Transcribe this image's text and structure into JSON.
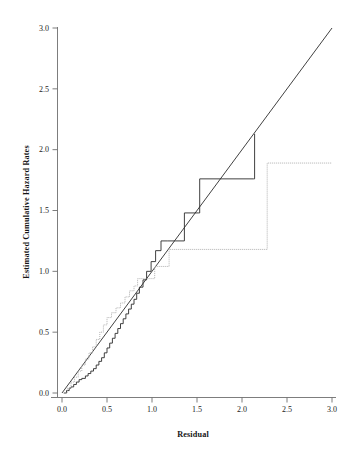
{
  "chart_data": {
    "type": "line",
    "title": "",
    "xlabel": "Residual",
    "ylabel": "Estimated Cumulative Hazard Rates",
    "xlim": [
      0.0,
      3.0
    ],
    "ylim": [
      0.0,
      3.0
    ],
    "grid": false,
    "legend": "none",
    "xticks": [
      "0.0",
      "0.5",
      "1.0",
      "1.5",
      "2.0",
      "2.5",
      "3.0"
    ],
    "xtick_values": [
      0.0,
      0.5,
      1.0,
      1.5,
      2.0,
      2.5,
      3.0
    ],
    "yticks": [
      "0.0",
      "0.5",
      "1.0",
      "1.5",
      "2.0",
      "2.5",
      "3.0"
    ],
    "ytick_values": [
      0.0,
      0.5,
      1.0,
      1.5,
      2.0,
      2.5,
      3.0
    ],
    "colors": {
      "reference_line": "#2b2b2b",
      "black_step": "#2b2b2b",
      "gray_step": "#a8a8a8",
      "axis": "#6e6e6e",
      "text": "#1c1c1c",
      "background": "#ffffff"
    },
    "series": [
      {
        "name": "reference-line",
        "style": "solid-straight",
        "color": "#2b2b2b",
        "x": [
          0.0,
          3.0
        ],
        "values": [
          0.0,
          3.0
        ]
      },
      {
        "name": "black-step-curve",
        "style": "step-solid",
        "color": "#2b2b2b",
        "x": [
          0.02,
          0.05,
          0.08,
          0.1,
          0.13,
          0.16,
          0.19,
          0.22,
          0.26,
          0.29,
          0.32,
          0.35,
          0.38,
          0.41,
          0.44,
          0.47,
          0.5,
          0.53,
          0.56,
          0.59,
          0.62,
          0.65,
          0.68,
          0.71,
          0.74,
          0.77,
          0.8,
          0.83,
          0.86,
          0.9,
          0.94,
          0.99,
          1.04,
          1.1,
          1.17,
          1.26,
          1.36,
          1.52,
          1.53,
          2.13,
          2.14
        ],
        "values": [
          0.0,
          0.02,
          0.04,
          0.05,
          0.07,
          0.09,
          0.11,
          0.12,
          0.14,
          0.16,
          0.18,
          0.2,
          0.23,
          0.26,
          0.29,
          0.33,
          0.37,
          0.41,
          0.45,
          0.49,
          0.53,
          0.57,
          0.61,
          0.65,
          0.69,
          0.73,
          0.77,
          0.82,
          0.87,
          0.93,
          1.0,
          1.08,
          1.17,
          1.25,
          1.25,
          1.25,
          1.48,
          1.48,
          1.76,
          1.76,
          2.13
        ]
      },
      {
        "name": "gray-dotted-step-curve",
        "style": "step-dotted",
        "color": "#a8a8a8",
        "x": [
          0.02,
          0.06,
          0.1,
          0.14,
          0.18,
          0.22,
          0.26,
          0.3,
          0.34,
          0.38,
          0.42,
          0.46,
          0.5,
          0.55,
          0.6,
          0.65,
          0.7,
          0.75,
          0.8,
          0.84,
          0.9,
          0.96,
          1.03,
          1.1,
          1.19,
          1.28,
          2.28,
          3.0
        ],
        "values": [
          0.0,
          0.04,
          0.09,
          0.13,
          0.18,
          0.23,
          0.28,
          0.33,
          0.38,
          0.44,
          0.5,
          0.56,
          0.62,
          0.66,
          0.7,
          0.74,
          0.79,
          0.84,
          0.88,
          0.94,
          0.94,
          0.94,
          1.04,
          1.04,
          1.18,
          1.18,
          1.89,
          1.89
        ]
      }
    ],
    "annotations": []
  },
  "axes": {
    "x_title": "Residual",
    "y_title": "Estimated Cumulative Hazard Rates"
  }
}
